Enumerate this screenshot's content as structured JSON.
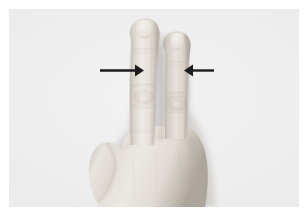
{
  "figure": {
    "kind": "photograph",
    "caption": "",
    "background_color": "#f0f0f0",
    "paper_color": "#ffffff",
    "skin_color": "#e6e2dc",
    "skin_shadow_color": "#b9b2a9",
    "annotation_color": "#1a1a1a"
  },
  "photo": {
    "x": 9,
    "y": 9,
    "width": 290,
    "height": 198
  },
  "annotations": [
    {
      "name": "left-arrow",
      "type": "arrow",
      "direction": "right",
      "color": "#1a1a1a",
      "tail_x": 100,
      "tip_x": 142,
      "y": 70,
      "points_at": "index-finger proximal phalanx, left edge",
      "label": ""
    },
    {
      "name": "right-arrow",
      "type": "arrow",
      "direction": "left",
      "color": "#1a1a1a",
      "tail_x": 214,
      "tip_x": 182,
      "y": 70,
      "points_at": "middle-finger proximal phalanx, right edge",
      "label": ""
    }
  ],
  "hand": {
    "fingers": [
      {
        "name": "index-finger",
        "state": "extended",
        "tip_y": 20,
        "label": ""
      },
      {
        "name": "middle-finger",
        "state": "extended",
        "tip_y": 33,
        "label": ""
      },
      {
        "name": "ring-finger",
        "state": "folded",
        "label": ""
      },
      {
        "name": "little-finger",
        "state": "folded",
        "label": ""
      },
      {
        "name": "thumb",
        "state": "folded",
        "label": ""
      }
    ],
    "gesture_name": "two-fingers-raised"
  }
}
